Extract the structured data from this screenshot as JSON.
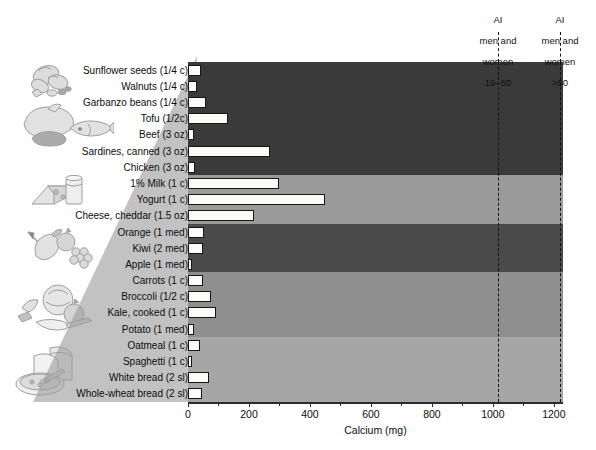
{
  "chart_data": {
    "type": "bar",
    "orientation": "horizontal",
    "title": "",
    "xlabel": "Calcium (mg)",
    "ylabel": "",
    "xlim": [
      0,
      1230
    ],
    "xticks": [
      0,
      200,
      400,
      600,
      800,
      1000,
      1200
    ],
    "xtick_labels": [
      "0",
      "200",
      "400",
      "600",
      "800",
      "1000",
      "1200"
    ],
    "grid": false,
    "legend": "none",
    "categories": [
      "Sunflower seeds (1/4 c)",
      "Walnuts (1/4 c)",
      "Garbanzo beans (1/4 c)",
      "Tofu (1/2c)",
      "Beef (3 oz)",
      "Sardines, canned (3 oz)",
      "Chicken (3 oz)",
      "1% Milk (1 c)",
      "Yogurt (1 c)",
      "Cheese, cheddar (1.5 oz)",
      "Orange (1 med)",
      "Kiwi (2 med)",
      "Apple (1 med)",
      "Carrots (1 c)",
      "Broccoli (1/2 c)",
      "Kale, cooked (1 c)",
      "Potato (1 med)",
      "Oatmeal (1 c)",
      "Spaghetti (1 c)",
      "White bread (2 sl)",
      "Whole-wheat bread (2 sl)"
    ],
    "values": [
      42,
      28,
      60,
      130,
      20,
      270,
      22,
      300,
      450,
      215,
      52,
      50,
      10,
      48,
      75,
      92,
      20,
      40,
      14,
      70,
      45
    ],
    "groups": [
      {
        "name": "nuts-seeds-protein",
        "start": 0,
        "end": 6,
        "shade": "#3a3a3a"
      },
      {
        "name": "dairy",
        "start": 7,
        "end": 9,
        "shade": "#9a9a9a"
      },
      {
        "name": "fruits",
        "start": 10,
        "end": 12,
        "shade": "#4a4a4a"
      },
      {
        "name": "vegetables",
        "start": 13,
        "end": 16,
        "shade": "#8f8f8f"
      },
      {
        "name": "grains",
        "start": 17,
        "end": 20,
        "shade": "#a6a6a6"
      }
    ],
    "reference_lines": [
      {
        "name": "ai-19-50",
        "value": 1000,
        "label": "AI\nmen and\nwomen\n19–50",
        "style": "dashed"
      },
      {
        "name": "ai-over-50",
        "value": 1200,
        "label": "AI\nmen and\nwomen\n>50",
        "style": "dashed"
      }
    ],
    "bar_fill": "#fbfbf8",
    "bar_stroke": "#15151a"
  },
  "axis": {
    "title": "Calcium (mg)"
  },
  "reference": {
    "line1": {
      "line1_l1": "AI",
      "line1_l2": "men and",
      "line1_l3": "women",
      "line1_l4": "19–50"
    },
    "line2": {
      "line2_l1": "AI",
      "line2_l2": "men and",
      "line2_l3": "women",
      "line2_l4": ">50"
    }
  },
  "illustrations": [
    {
      "name": "nuts-and-seeds-illustration"
    },
    {
      "name": "meat-poultry-fish-illustration"
    },
    {
      "name": "dairy-cheese-milk-illustration"
    },
    {
      "name": "fruit-illustration"
    },
    {
      "name": "vegetables-illustration"
    },
    {
      "name": "bread-and-cereal-illustration"
    }
  ],
  "caption": ""
}
